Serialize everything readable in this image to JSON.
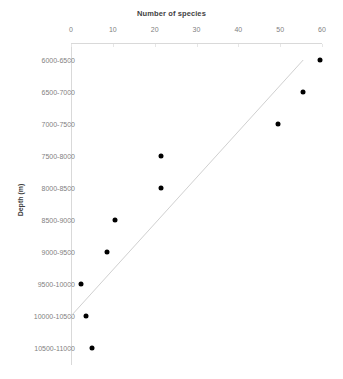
{
  "chart_data": {
    "type": "scatter",
    "title": "Number of species",
    "xlabel": "Number of species",
    "ylabel": "Depth (m)",
    "xlim": [
      0,
      60
    ],
    "xticks": [
      0,
      10,
      20,
      30,
      40,
      50,
      60
    ],
    "xtick_labels": [
      "0",
      "10",
      "20",
      "30",
      "40",
      "50",
      "60"
    ],
    "categories": [
      "6000-6500",
      "6500-7000",
      "7000-7500",
      "7500-8000",
      "8000-8500",
      "8500-9000",
      "9000-9500",
      "9500-10000",
      "10000-10500",
      "10500-11000"
    ],
    "values": [
      59.5,
      55.5,
      49.5,
      21.5,
      21.5,
      10.5,
      8.5,
      2.5,
      3.5,
      5
    ],
    "grid": false,
    "legend": null,
    "axis_position": "x-axis-top",
    "series": [
      {
        "name": "Number of species",
        "marker": "filled-circle",
        "color": "#000000",
        "points": [
          {
            "category": "6000-6500",
            "value": 59.5
          },
          {
            "category": "6500-7000",
            "value": 55.5
          },
          {
            "category": "7000-7500",
            "value": 49.5
          },
          {
            "category": "7500-8000",
            "value": 21.5
          },
          {
            "category": "8000-8500",
            "value": 21.5
          },
          {
            "category": "8500-9000",
            "value": 10.5
          },
          {
            "category": "9000-9500",
            "value": 8.5
          },
          {
            "category": "9500-10000",
            "value": 2.5
          },
          {
            "category": "10000-10500",
            "value": 3.5
          },
          {
            "category": "10500-11000",
            "value": 5
          }
        ]
      }
    ],
    "trendline": {
      "color": "#d0d0d0",
      "start": {
        "category": "10000-10500",
        "value": 0
      },
      "end": {
        "category": "6000-6500",
        "value": 55.5
      }
    }
  }
}
